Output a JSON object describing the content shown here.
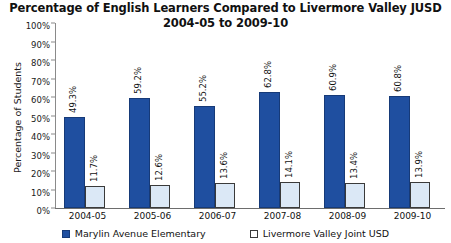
{
  "chart_data": {
    "type": "bar",
    "title": "Percentage of English Learners Compared to Livermore Valley JUSD",
    "subtitle": "2004-05 to 2009-10",
    "xlabel": "",
    "ylabel": "Percentage of Students",
    "ylim": [
      0,
      100
    ],
    "yticks": [
      "0%",
      "10%",
      "20%",
      "30%",
      "40%",
      "50%",
      "60%",
      "70%",
      "80%",
      "90%",
      "100%"
    ],
    "ytick_values": [
      0,
      10,
      20,
      30,
      40,
      50,
      60,
      70,
      80,
      90,
      100
    ],
    "grid": false,
    "legend_position": "bottom",
    "categories": [
      "2004-05",
      "2005-06",
      "2006-07",
      "2007-08",
      "2008-09",
      "2009-10"
    ],
    "series": [
      {
        "name": "Marylin Avenue Elementary",
        "color": "#1f4fa0",
        "values": [
          49.3,
          59.2,
          55.2,
          62.8,
          60.9,
          60.8
        ],
        "labels": [
          "49.3%",
          "59.2%",
          "55.2%",
          "62.8%",
          "60.9%",
          "60.8%"
        ]
      },
      {
        "name": "Livermore Valley Joint USD",
        "color": "#dbe8f6",
        "values": [
          11.7,
          12.6,
          13.6,
          14.1,
          13.4,
          13.9
        ],
        "labels": [
          "11.7%",
          "12.6%",
          "13.6%",
          "14.1%",
          "13.4%",
          "13.9%"
        ]
      }
    ]
  }
}
